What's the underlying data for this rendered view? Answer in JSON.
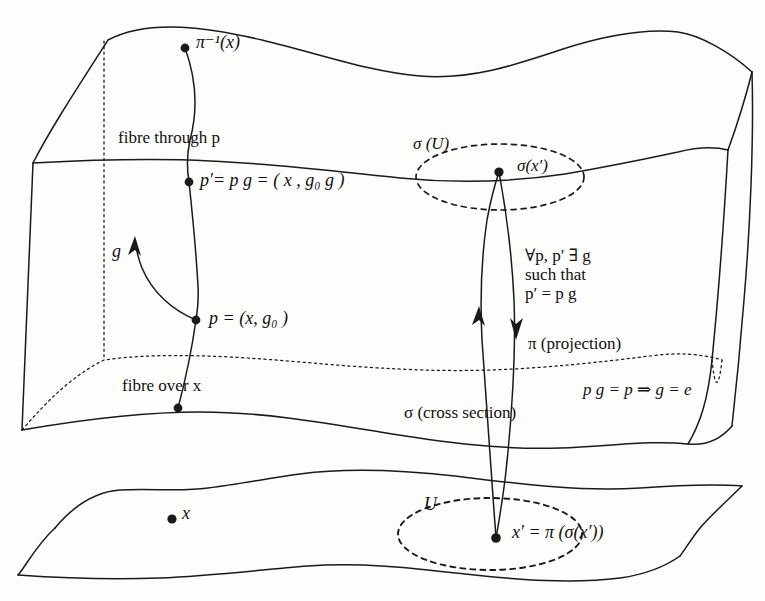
{
  "figure": {
    "kind": "fibre-bundle-diagram",
    "ink_color": "#1a1a1a",
    "background_color": "#fdfdfb"
  },
  "labels": {
    "pi_inverse_x": "π⁻¹(x)",
    "fibre_through_p": "fibre through p",
    "p_prime_equation": "p′= p g = ( x , g₀ g )",
    "g_action": "g",
    "p_equation": "p = (x, g₀ )",
    "fibre_over_x": "fibre over x",
    "sigma_U": "σ (U)",
    "sigma_x_prime": "σ(x′)",
    "exists_line1": "∀p, p′ ∃ g",
    "exists_line2": "such that",
    "exists_line3": "p′ = p g",
    "pi_projection": "π (projection)",
    "free_action": "p g = p ⇒ g = e",
    "sigma_cross_section": "σ (cross section)",
    "U_label": "U",
    "x_point": "x",
    "x_prime_equation": "x′ = π (σ(x′))"
  },
  "points": [
    {
      "name": "pi-inverse-x-point",
      "x": 185,
      "y": 48
    },
    {
      "name": "p-prime-point",
      "x": 189,
      "y": 182
    },
    {
      "name": "p-point",
      "x": 196,
      "y": 320
    },
    {
      "name": "fibre-bottom-point",
      "x": 178,
      "y": 408
    },
    {
      "name": "sigma-x-prime-point",
      "x": 499,
      "y": 172
    },
    {
      "name": "x-point",
      "x": 172,
      "y": 519
    },
    {
      "name": "x-prime-point",
      "x": 496,
      "y": 538
    }
  ]
}
